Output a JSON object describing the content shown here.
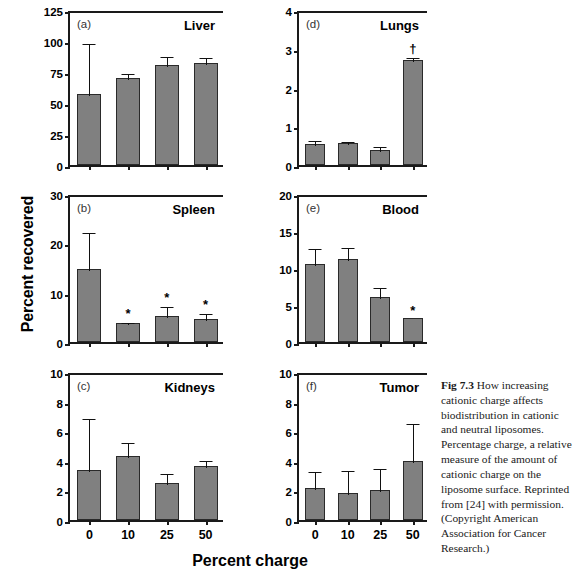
{
  "figure": {
    "xlabel": "Percent charge",
    "ylabel": "Percent recovered",
    "caption_label": "Fig 7.3",
    "caption_text": " How increasing cationic charge affects biodistribution in cationic and neutral liposomes. Percentage charge, a relative measure of the amount of cationic charge on the liposome surface. Reprinted from [24] with permission. (Copyright American Association for Cancer Research.)",
    "bar_color": "#808080",
    "axis_color": "#1a1a1a"
  },
  "chart_data": [
    {
      "type": "bar",
      "panel": "(a)",
      "title": "Liver",
      "categories": [
        "0",
        "10",
        "25",
        "50"
      ],
      "values": [
        57,
        70,
        81,
        82
      ],
      "errors": [
        42,
        5,
        8,
        6
      ],
      "significance": [
        "",
        "",
        "",
        ""
      ],
      "xlabel": "Percent charge",
      "ylabel": "Percent recovered",
      "ylim": [
        0,
        125
      ],
      "yticks": [
        0,
        25,
        50,
        75,
        100,
        125
      ],
      "grid": false,
      "legend": "none"
    },
    {
      "type": "bar",
      "panel": "(d)",
      "title": "Lungs",
      "categories": [
        "0",
        "10",
        "25",
        "50"
      ],
      "values": [
        0.55,
        0.57,
        0.38,
        2.7
      ],
      "errors": [
        0.13,
        0.07,
        0.13,
        0.12
      ],
      "significance": [
        "",
        "",
        "",
        "†"
      ],
      "xlabel": "Percent charge",
      "ylabel": "Percent recovered",
      "ylim": [
        0,
        4
      ],
      "yticks": [
        0,
        1,
        2,
        3,
        4
      ],
      "grid": false,
      "legend": "none"
    },
    {
      "type": "bar",
      "panel": "(b)",
      "title": "Spleen",
      "categories": [
        "0",
        "10",
        "25",
        "50"
      ],
      "values": [
        14.8,
        3.8,
        5.3,
        4.7
      ],
      "errors": [
        7.6,
        0.4,
        2.1,
        1.3
      ],
      "significance": [
        "",
        "*",
        "*",
        "*"
      ],
      "xlabel": "Percent charge",
      "ylabel": "Percent recovered",
      "ylim": [
        0,
        30
      ],
      "yticks": [
        0,
        10,
        20,
        30
      ],
      "grid": false,
      "legend": "none"
    },
    {
      "type": "bar",
      "panel": "(e)",
      "title": "Blood",
      "categories": [
        "0",
        "10",
        "25",
        "50"
      ],
      "values": [
        10.6,
        11.2,
        6.1,
        3.2
      ],
      "errors": [
        2.2,
        1.8,
        1.5,
        0.0
      ],
      "significance": [
        "",
        "",
        "",
        "*"
      ],
      "xlabel": "Percent charge",
      "ylabel": "Percent recovered",
      "ylim": [
        0,
        20
      ],
      "yticks": [
        0,
        5,
        10,
        15,
        20
      ],
      "grid": false,
      "legend": "none"
    },
    {
      "type": "bar",
      "panel": "(c)",
      "title": "Kidneys",
      "categories": [
        "0",
        "10",
        "25",
        "50"
      ],
      "values": [
        3.35,
        4.35,
        2.5,
        3.65
      ],
      "errors": [
        3.6,
        1.0,
        0.75,
        0.5
      ],
      "significance": [
        "",
        "",
        "",
        ""
      ],
      "xlabel": "Percent charge",
      "ylabel": "Percent recovered",
      "ylim": [
        0,
        10
      ],
      "yticks": [
        0,
        2,
        4,
        6,
        8,
        10
      ],
      "grid": false,
      "legend": "none"
    },
    {
      "type": "bar",
      "panel": "(f)",
      "title": "Tumor",
      "categories": [
        "0",
        "10",
        "25",
        "50"
      ],
      "values": [
        2.15,
        1.85,
        2.0,
        4.0
      ],
      "errors": [
        1.2,
        1.6,
        1.6,
        2.6
      ],
      "significance": [
        "",
        "",
        "",
        ""
      ],
      "xlabel": "Percent charge",
      "ylabel": "Percent recovered",
      "ylim": [
        0,
        10
      ],
      "yticks": [
        0,
        2,
        4,
        6,
        8,
        10
      ],
      "grid": false,
      "legend": "none"
    }
  ],
  "panel_layout": [
    {
      "key": "0",
      "left": 68,
      "top": 12,
      "w": 155,
      "h": 155,
      "show_xticklabels": false
    },
    {
      "key": "1",
      "left": 297,
      "top": 12,
      "w": 130,
      "h": 155,
      "show_xticklabels": false
    },
    {
      "key": "2",
      "left": 68,
      "top": 196,
      "w": 155,
      "h": 148,
      "show_xticklabels": false
    },
    {
      "key": "3",
      "left": 297,
      "top": 196,
      "w": 130,
      "h": 148,
      "show_xticklabels": false
    },
    {
      "key": "4",
      "left": 68,
      "top": 374,
      "w": 155,
      "h": 148,
      "show_xticklabels": true
    },
    {
      "key": "5",
      "left": 297,
      "top": 374,
      "w": 130,
      "h": 148,
      "show_xticklabels": true
    }
  ]
}
